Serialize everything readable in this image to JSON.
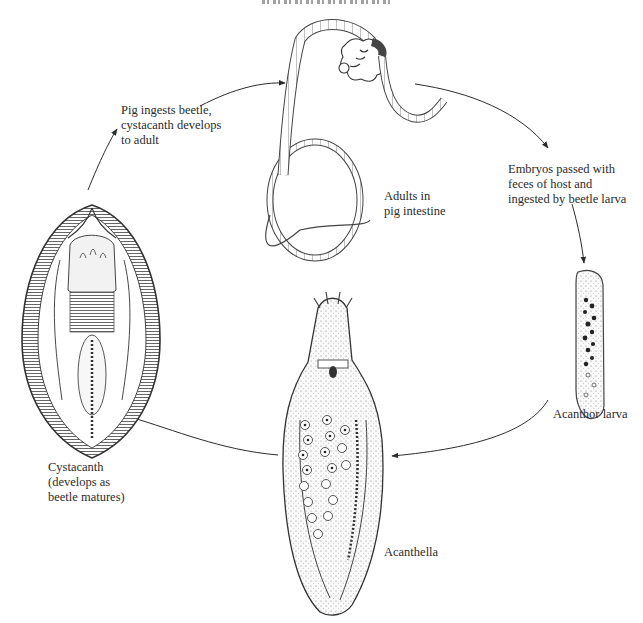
{
  "diagram": {
    "header_fragment": "cropped running header (illegible)",
    "stages": [
      {
        "id": "adults",
        "label_lines": [
          "Adults in",
          "pig intestine"
        ]
      },
      {
        "id": "acanthor",
        "label_lines": [
          "Acanthor larva"
        ]
      },
      {
        "id": "acanthella",
        "label_lines": [
          "Acanthella"
        ]
      },
      {
        "id": "cystacanth",
        "label_lines": [
          "Cystacanth",
          "(develops as",
          "beetle matures)"
        ]
      }
    ],
    "transitions": [
      {
        "from": "adults",
        "to": "acanthor",
        "label_lines": [
          "Embryos passed with",
          "feces of host and",
          "ingested by beetle larva"
        ]
      },
      {
        "from": "acanthor",
        "to": "acanthella",
        "label_lines": []
      },
      {
        "from": "acanthella",
        "to": "cystacanth",
        "label_lines": []
      },
      {
        "from": "cystacanth",
        "to": "adults",
        "label_lines": [
          "Pig ingests beetle,",
          "cystacanth develops",
          "to adult"
        ]
      }
    ],
    "colors": {
      "ink": "#2b2b2b",
      "background": "#ffffff",
      "shading": "#8a8a8a"
    }
  }
}
